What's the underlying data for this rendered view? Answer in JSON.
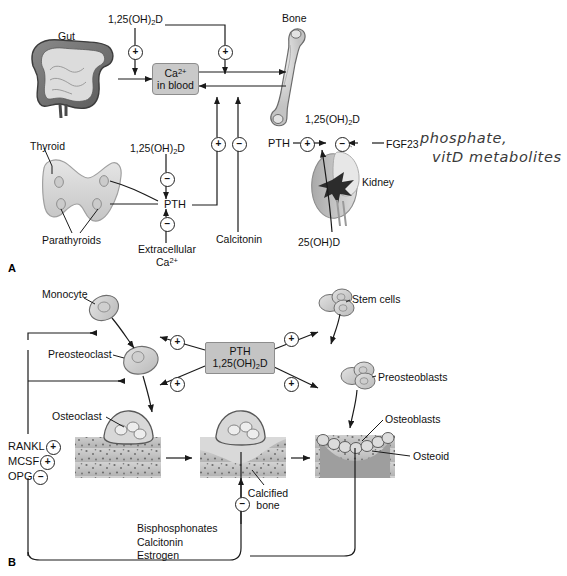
{
  "figure": {
    "panels": [
      {
        "letter": "A",
        "name": "calcium-homeostasis"
      },
      {
        "letter": "B",
        "name": "bone-remodeling"
      }
    ],
    "colors": {
      "box_fill": "#c9c9c9",
      "box_stroke": "#8d8d8d",
      "line": "#1a1a1a",
      "bone_fill": "#d6d6d6",
      "tissue_fill": "#bdbdbd",
      "handwriting": "#3a3a3a"
    }
  },
  "panelA": {
    "letter": "A",
    "labels": {
      "gut": "Gut",
      "bone": "Bone",
      "thyroid": "Thyroid",
      "parathyroids": "Parathyroids",
      "kidney": "Kidney",
      "pth_thyroid": "PTH",
      "pth_kidney": "PTH",
      "calcitonin": "Calcitonin",
      "fgf23": "FGF23",
      "vitd_gut": "1,25(OH)₂D",
      "vitd_thyroid": "1,25(OH)₂D",
      "vitd_kidney": "1,25(OH)₂D",
      "ohd25": "25(OH)D",
      "extracellular_ca": "Extracellular Ca²⁺",
      "extracellular_ca_line1": "Extracellular",
      "extracellular_ca_line2": "Ca²⁺"
    },
    "ca_box": {
      "line1": "Ca²⁺",
      "line2": "in blood"
    },
    "signs": {
      "gut_vitd": "+",
      "bone_vitd": "+",
      "pth_to_ca": "+",
      "calcitonin_to_ca": "−",
      "vitd_inhibits_pth": "−",
      "ca_inhibits_pth": "−",
      "pth_stimulates_kidney": "+",
      "fgf23_inhibits_kidney": "−"
    },
    "annotation": {
      "line1": "phosphate,",
      "line2": "vitD metabolites"
    }
  },
  "panelB": {
    "letter": "B",
    "center_box": {
      "line1": "PTH",
      "line2": "1,25(OH)₂D"
    },
    "labels": {
      "monocyte": "Monocyte",
      "preosteoclast": "Preosteoclast",
      "osteoclast": "Osteoclast",
      "stem_cells": "Stem cells",
      "preosteoblasts": "Preosteoblasts",
      "osteoblasts": "Osteoblasts",
      "osteoid": "Osteoid",
      "calcified_bone_line1": "Calcified",
      "calcified_bone_line2": "bone",
      "calcified_bone": "Calcified bone"
    },
    "factors": [
      {
        "name": "RANKL",
        "sign": "+"
      },
      {
        "name": "MCSF",
        "sign": "+"
      },
      {
        "name": "OPG",
        "sign": "−"
      }
    ],
    "inhibitors": {
      "sign": "−",
      "items": [
        "Bisphosphonates",
        "Calcitonin",
        "Estrogen"
      ]
    },
    "signs": {
      "pth_to_monocyte": "+",
      "pth_to_osteoclast": "+",
      "pth_to_stemcells": "+",
      "pth_to_osteoblast": "+"
    }
  }
}
